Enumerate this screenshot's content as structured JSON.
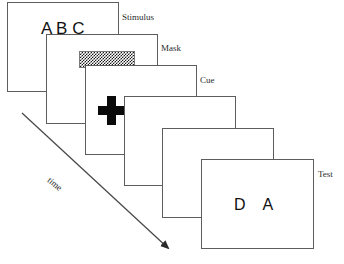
{
  "diagram": {
    "canvas": {
      "width": 344,
      "height": 264,
      "background": "#ffffff"
    },
    "frame_border_color": "#5d5d5d",
    "ink_color": "#111111",
    "frames": [
      {
        "id": "frame-stimulus",
        "label": "Stimulus",
        "content_type": "letters",
        "content": "A B C",
        "x": 7,
        "y": 2,
        "width": 112,
        "height": 90
      },
      {
        "id": "frame-mask",
        "label": "Mask",
        "content_type": "checkerboard",
        "content": "",
        "x": 46,
        "y": 34,
        "width": 112,
        "height": 90
      },
      {
        "id": "frame-cue",
        "label": "Cue",
        "content_type": "cross",
        "content": "",
        "x": 85,
        "y": 65,
        "width": 112,
        "height": 90
      },
      {
        "id": "frame-blank-1",
        "label": "",
        "content_type": "blank",
        "content": "",
        "x": 124,
        "y": 96,
        "width": 112,
        "height": 90
      },
      {
        "id": "frame-blank-2",
        "label": "",
        "content_type": "blank",
        "content": "",
        "x": 162,
        "y": 128,
        "width": 112,
        "height": 90
      },
      {
        "id": "frame-test",
        "label": "Test",
        "content_type": "letters",
        "content": "D    A",
        "x": 201,
        "y": 159,
        "width": 113,
        "height": 90
      }
    ],
    "labels": [
      {
        "name": "stimulus",
        "text": "Stimulus",
        "x": 122,
        "y": 12
      },
      {
        "name": "mask",
        "text": "Mask",
        "x": 161,
        "y": 43
      },
      {
        "name": "cue",
        "text": "Cue",
        "x": 200,
        "y": 75
      },
      {
        "name": "test",
        "text": "Test",
        "x": 318,
        "y": 169
      }
    ],
    "axis": {
      "name": "time-arrow",
      "text": "time",
      "start_x": 22,
      "start_y": 113,
      "end_x": 172,
      "end_y": 252,
      "label_x": 52,
      "label_y": 175
    },
    "mask_patch": {
      "x": 78,
      "y": 50,
      "width": 56,
      "height": 17
    },
    "cue_cross": {
      "x": 97,
      "y": 95,
      "width": 27,
      "height": 29
    },
    "stimulus_text_pos": {
      "x": 40,
      "y": 19
    },
    "test_text_pos": {
      "x": 233,
      "y": 196
    }
  }
}
